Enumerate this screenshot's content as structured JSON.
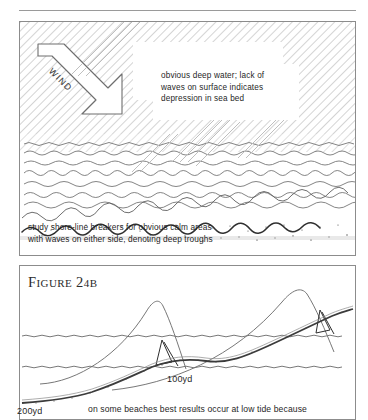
{
  "figure": {
    "top_rule": true,
    "panel_top": {
      "name": "sea-surface-diagram",
      "wind_label": "WIND",
      "callout_lines": [
        "obvious deep water; lack of",
        "waves on surface indicates",
        "depression in sea bed"
      ],
      "caption_lines": [
        "study shore-line breakers for obvious calm areas",
        "with waves on either side, denoting deep troughs"
      ]
    },
    "panel_bottom": {
      "name": "beach-profile-diagram",
      "title_prefix": "F",
      "title_word": "IGURE",
      "title_number": "24",
      "title_suffix": "B",
      "title_full": "FIGURE 24B",
      "scale_labels": [
        {
          "text": "100yd"
        },
        {
          "text": "200yd"
        }
      ],
      "bottom_note": "on some beaches best results occur at low tide because"
    }
  },
  "colors": {
    "ink": "#1f1f1f",
    "rule": "#9a9a9a",
    "border": "#8c8c8c",
    "hatch": "#b4b4b4",
    "wave": "#6f6f6f",
    "sand": "#555555"
  },
  "chart_data": {
    "type": "line",
    "title": "FIGURE 24B",
    "xlabel": "",
    "ylabel": "",
    "annotations": [
      "100yd",
      "200yd",
      "on some beaches best results occur at low tide because"
    ],
    "series": [
      {
        "name": "beach-profile",
        "description": "sloping sea bed rising left to right",
        "x": [
          0,
          40,
          80,
          120,
          160,
          200,
          240,
          280,
          320,
          337
        ],
        "y": [
          185,
          180,
          168,
          150,
          112,
          104,
          96,
          80,
          62,
          48
        ]
      },
      {
        "name": "wave-crest-inner",
        "description": "first breaking wave crest",
        "peak_x": 140,
        "peak_y": 38
      },
      {
        "name": "wave-crest-outer",
        "description": "second breaking wave crest near shore",
        "peak_x": 285,
        "peak_y": 18
      }
    ],
    "water_levels": [
      70,
      101
    ]
  }
}
